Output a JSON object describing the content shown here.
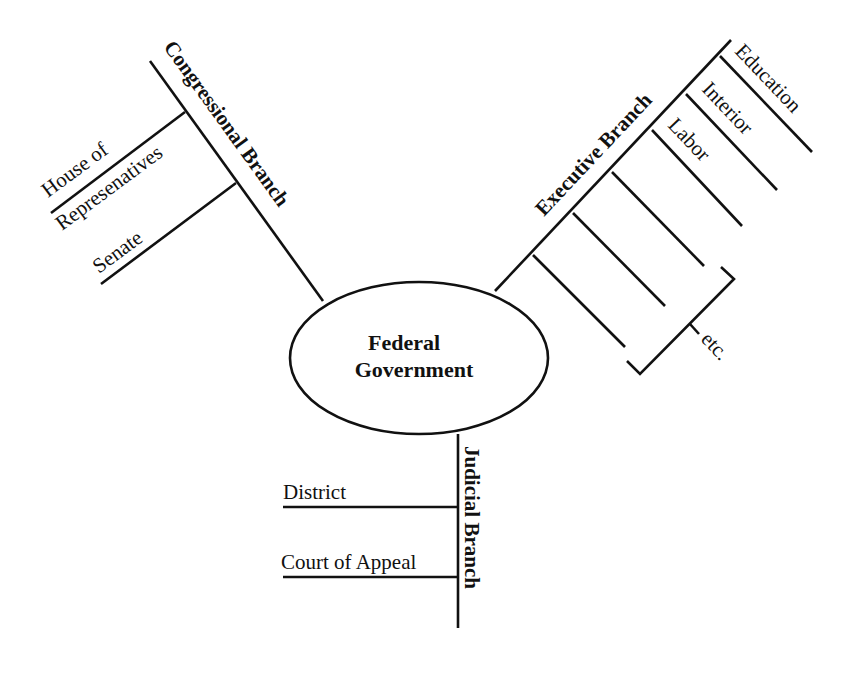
{
  "center": {
    "line1": "Federal",
    "line2": "Government"
  },
  "congressional": {
    "label": "Congressional Branch",
    "items": [
      {
        "line1": "House of",
        "line2": "Represenatives"
      },
      {
        "line1": "Senate"
      }
    ]
  },
  "executive": {
    "label": "Executive Branch",
    "items": [
      "Education",
      "Interior",
      "Labor",
      "",
      "",
      ""
    ],
    "etc_label": "etc."
  },
  "judicial": {
    "label": "Judicial Branch",
    "items": [
      "District",
      "Court of Appeal"
    ]
  },
  "colors": {
    "line": "#111111",
    "background": "#ffffff"
  }
}
